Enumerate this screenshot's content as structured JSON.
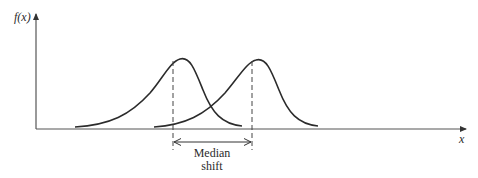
{
  "diagram": {
    "y_axis_label": "f(x)",
    "x_axis_label": "x",
    "annotation": {
      "line1": "Median",
      "line2": "shift"
    },
    "curves": [
      {
        "name": "original-distribution",
        "median_x": 173,
        "peak_x": 182
      },
      {
        "name": "shifted-distribution",
        "median_x": 252,
        "peak_x": 258
      }
    ],
    "colors": {
      "stroke": "#2b2b2b",
      "axis": "#555555",
      "background": "#ffffff"
    }
  }
}
